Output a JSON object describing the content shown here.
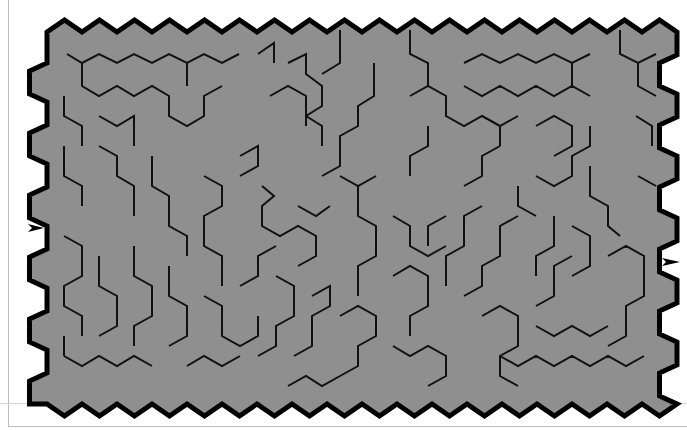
{
  "maze": {
    "type": "hexagonal-maze",
    "colors": {
      "fill": "#8f8f8f",
      "wall": "#111111",
      "border": "#000000",
      "background": "#ffffff"
    },
    "grid": {
      "origin_x": 47,
      "origin_y": 20,
      "hex_width": 35,
      "row_height": 31,
      "cols": 18,
      "rows": 12
    },
    "entrance": {
      "side": "left",
      "x": 28,
      "y": 228,
      "glyph": "arrow-right"
    },
    "exit": {
      "side": "right",
      "x": 668,
      "y": 262,
      "glyph": "arrow-right"
    },
    "walls": [
      [
        [
          67,
          54
        ],
        [
          82,
          63
        ],
        [
          99,
          54
        ],
        [
          117,
          63
        ],
        [
          134,
          54
        ],
        [
          152,
          63
        ],
        [
          169,
          54
        ],
        [
          187,
          63
        ],
        [
          204,
          54
        ],
        [
          222,
          63
        ],
        [
          239,
          54
        ]
      ],
      [
        [
          82,
          63
        ],
        [
          82,
          86
        ],
        [
          99,
          96
        ],
        [
          117,
          86
        ],
        [
          134,
          96
        ],
        [
          152,
          86
        ],
        [
          169,
          96
        ],
        [
          169,
          116
        ],
        [
          187,
          126
        ],
        [
          204,
          116
        ],
        [
          204,
          96
        ],
        [
          222,
          86
        ]
      ],
      [
        [
          187,
          63
        ],
        [
          187,
          86
        ]
      ],
      [
        [
          64,
          96
        ],
        [
          64,
          116
        ],
        [
          82,
          126
        ],
        [
          82,
          146
        ]
      ],
      [
        [
          99,
          116
        ],
        [
          117,
          126
        ],
        [
          134,
          116
        ],
        [
          134,
          146
        ]
      ],
      [
        [
          258,
          54
        ],
        [
          274,
          43
        ],
        [
          274,
          63
        ]
      ],
      [
        [
          288,
          63
        ],
        [
          306,
          54
        ],
        [
          306,
          74
        ],
        [
          322,
          86
        ],
        [
          322,
          106
        ],
        [
          306,
          116
        ],
        [
          306,
          126
        ]
      ],
      [
        [
          270,
          96
        ],
        [
          288,
          86
        ],
        [
          306,
          96
        ],
        [
          306,
          116
        ],
        [
          322,
          126
        ],
        [
          322,
          146
        ]
      ],
      [
        [
          340,
          30
        ],
        [
          340,
          63
        ],
        [
          322,
          74
        ]
      ],
      [
        [
          374,
          63
        ],
        [
          374,
          96
        ],
        [
          358,
          106
        ],
        [
          358,
          126
        ],
        [
          340,
          136
        ],
        [
          340,
          166
        ],
        [
          322,
          176
        ]
      ],
      [
        [
          410,
          30
        ],
        [
          410,
          54
        ],
        [
          428,
          63
        ],
        [
          428,
          86
        ]
      ],
      [
        [
          410,
          96
        ],
        [
          428,
          86
        ],
        [
          446,
          96
        ],
        [
          446,
          116
        ],
        [
          464,
          126
        ],
        [
          482,
          116
        ],
        [
          500,
          126
        ],
        [
          500,
          146
        ]
      ],
      [
        [
          428,
          126
        ],
        [
          428,
          146
        ],
        [
          410,
          156
        ],
        [
          410,
          176
        ]
      ],
      [
        [
          464,
          63
        ],
        [
          482,
          54
        ],
        [
          500,
          63
        ],
        [
          518,
          54
        ],
        [
          536,
          63
        ],
        [
          554,
          54
        ],
        [
          572,
          63
        ],
        [
          590,
          54
        ]
      ],
      [
        [
          464,
          86
        ],
        [
          482,
          96
        ],
        [
          500,
          86
        ],
        [
          518,
          96
        ],
        [
          536,
          86
        ],
        [
          554,
          96
        ],
        [
          572,
          86
        ],
        [
          590,
          96
        ]
      ],
      [
        [
          572,
          63
        ],
        [
          572,
          86
        ]
      ],
      [
        [
          620,
          30
        ],
        [
          620,
          54
        ],
        [
          638,
          63
        ],
        [
          656,
          54
        ]
      ],
      [
        [
          638,
          63
        ],
        [
          638,
          86
        ],
        [
          656,
          96
        ]
      ],
      [
        [
          482,
          116
        ],
        [
          500,
          126
        ],
        [
          518,
          116
        ]
      ],
      [
        [
          500,
          126
        ],
        [
          500,
          146
        ]
      ],
      [
        [
          536,
          126
        ],
        [
          554,
          116
        ],
        [
          572,
          126
        ],
        [
          572,
          146
        ],
        [
          554,
          156
        ]
      ],
      [
        [
          636,
          116
        ],
        [
          652,
          126
        ],
        [
          652,
          146
        ]
      ],
      [
        [
          638,
          176
        ],
        [
          656,
          186
        ]
      ],
      [
        [
          64,
          146
        ],
        [
          64,
          176
        ],
        [
          82,
          186
        ],
        [
          82,
          206
        ]
      ],
      [
        [
          99,
          146
        ],
        [
          117,
          156
        ],
        [
          117,
          176
        ],
        [
          134,
          186
        ],
        [
          134,
          216
        ]
      ],
      [
        [
          152,
          156
        ],
        [
          152,
          186
        ],
        [
          169,
          196
        ],
        [
          169,
          226
        ],
        [
          187,
          236
        ],
        [
          187,
          256
        ]
      ],
      [
        [
          204,
          176
        ],
        [
          222,
          186
        ],
        [
          222,
          206
        ],
        [
          204,
          216
        ],
        [
          204,
          246
        ],
        [
          222,
          256
        ],
        [
          222,
          286
        ]
      ],
      [
        [
          240,
          156
        ],
        [
          258,
          146
        ],
        [
          258,
          166
        ],
        [
          240,
          176
        ]
      ],
      [
        [
          262,
          186
        ],
        [
          274,
          196
        ],
        [
          262,
          206
        ],
        [
          262,
          226
        ],
        [
          280,
          236
        ],
        [
          298,
          226
        ],
        [
          316,
          236
        ],
        [
          316,
          256
        ],
        [
          298,
          266
        ]
      ],
      [
        [
          298,
          206
        ],
        [
          316,
          216
        ],
        [
          330,
          206
        ]
      ],
      [
        [
          340,
          176
        ],
        [
          358,
          186
        ],
        [
          376,
          176
        ]
      ],
      [
        [
          358,
          186
        ],
        [
          358,
          216
        ],
        [
          376,
          226
        ],
        [
          376,
          256
        ],
        [
          358,
          266
        ],
        [
          358,
          296
        ]
      ],
      [
        [
          393,
          216
        ],
        [
          410,
          226
        ],
        [
          410,
          246
        ],
        [
          428,
          256
        ],
        [
          446,
          246
        ]
      ],
      [
        [
          446,
          216
        ],
        [
          428,
          226
        ],
        [
          428,
          246
        ]
      ],
      [
        [
          464,
          186
        ],
        [
          482,
          176
        ],
        [
          482,
          156
        ],
        [
          500,
          146
        ]
      ],
      [
        [
          482,
          206
        ],
        [
          464,
          216
        ],
        [
          464,
          246
        ],
        [
          446,
          256
        ],
        [
          446,
          286
        ]
      ],
      [
        [
          518,
          186
        ],
        [
          518,
          206
        ],
        [
          536,
          216
        ]
      ],
      [
        [
          536,
          176
        ],
        [
          554,
          186
        ],
        [
          572,
          176
        ],
        [
          572,
          156
        ],
        [
          590,
          146
        ],
        [
          590,
          126
        ]
      ],
      [
        [
          590,
          166
        ],
        [
          590,
          196
        ],
        [
          608,
          206
        ],
        [
          608,
          226
        ],
        [
          620,
          236
        ]
      ],
      [
        [
          554,
          216
        ],
        [
          554,
          246
        ],
        [
          536,
          256
        ],
        [
          536,
          276
        ]
      ],
      [
        [
          572,
          226
        ],
        [
          590,
          236
        ],
        [
          590,
          266
        ],
        [
          572,
          276
        ]
      ],
      [
        [
          608,
          256
        ],
        [
          626,
          246
        ],
        [
          644,
          256
        ],
        [
          644,
          296
        ],
        [
          626,
          306
        ],
        [
          626,
          336
        ],
        [
          608,
          346
        ]
      ],
      [
        [
          64,
          236
        ],
        [
          82,
          246
        ],
        [
          82,
          276
        ],
        [
          64,
          286
        ],
        [
          64,
          306
        ],
        [
          82,
          316
        ],
        [
          82,
          336
        ]
      ],
      [
        [
          99,
          256
        ],
        [
          99,
          286
        ],
        [
          117,
          296
        ],
        [
          117,
          326
        ],
        [
          99,
          336
        ]
      ],
      [
        [
          134,
          246
        ],
        [
          134,
          276
        ],
        [
          152,
          286
        ],
        [
          152,
          316
        ],
        [
          134,
          326
        ],
        [
          134,
          346
        ]
      ],
      [
        [
          169,
          266
        ],
        [
          169,
          296
        ],
        [
          187,
          306
        ],
        [
          187,
          336
        ],
        [
          169,
          346
        ]
      ],
      [
        [
          204,
          296
        ],
        [
          222,
          306
        ],
        [
          222,
          336
        ],
        [
          240,
          346
        ],
        [
          258,
          336
        ],
        [
          258,
          316
        ]
      ],
      [
        [
          240,
          286
        ],
        [
          258,
          276
        ],
        [
          258,
          256
        ],
        [
          276,
          246
        ]
      ],
      [
        [
          276,
          276
        ],
        [
          294,
          286
        ],
        [
          294,
          316
        ],
        [
          276,
          326
        ],
        [
          276,
          346
        ],
        [
          258,
          356
        ]
      ],
      [
        [
          312,
          296
        ],
        [
          330,
          286
        ],
        [
          330,
          306
        ],
        [
          312,
          316
        ],
        [
          312,
          346
        ],
        [
          294,
          356
        ]
      ],
      [
        [
          340,
          316
        ],
        [
          358,
          306
        ],
        [
          376,
          316
        ],
        [
          376,
          336
        ],
        [
          358,
          346
        ],
        [
          358,
          366
        ],
        [
          340,
          376
        ]
      ],
      [
        [
          393,
          276
        ],
        [
          410,
          266
        ],
        [
          428,
          276
        ],
        [
          428,
          306
        ],
        [
          410,
          316
        ],
        [
          410,
          336
        ]
      ],
      [
        [
          393,
          346
        ],
        [
          410,
          356
        ],
        [
          428,
          346
        ],
        [
          446,
          356
        ],
        [
          446,
          376
        ],
        [
          428,
          386
        ]
      ],
      [
        [
          464,
          296
        ],
        [
          482,
          286
        ],
        [
          482,
          266
        ],
        [
          500,
          256
        ],
        [
          500,
          226
        ],
        [
          518,
          216
        ]
      ],
      [
        [
          482,
          316
        ],
        [
          500,
          306
        ],
        [
          518,
          316
        ],
        [
          518,
          346
        ],
        [
          500,
          356
        ],
        [
          500,
          376
        ],
        [
          518,
          386
        ]
      ],
      [
        [
          536,
          306
        ],
        [
          554,
          296
        ],
        [
          554,
          266
        ],
        [
          572,
          256
        ]
      ],
      [
        [
          500,
          356
        ],
        [
          518,
          366
        ],
        [
          536,
          356
        ],
        [
          554,
          366
        ],
        [
          572,
          356
        ],
        [
          590,
          366
        ],
        [
          608,
          356
        ],
        [
          626,
          366
        ],
        [
          644,
          356
        ]
      ],
      [
        [
          536,
          326
        ],
        [
          554,
          336
        ],
        [
          572,
          326
        ],
        [
          590,
          336
        ],
        [
          608,
          326
        ]
      ],
      [
        [
          64,
          356
        ],
        [
          82,
          366
        ],
        [
          99,
          356
        ],
        [
          117,
          366
        ],
        [
          134,
          356
        ],
        [
          152,
          366
        ]
      ],
      [
        [
          64,
          336
        ],
        [
          64,
          356
        ]
      ],
      [
        [
          187,
          366
        ],
        [
          204,
          356
        ],
        [
          222,
          366
        ],
        [
          240,
          356
        ]
      ],
      [
        [
          288,
          386
        ],
        [
          306,
          376
        ],
        [
          322,
          386
        ],
        [
          340,
          376
        ]
      ]
    ]
  }
}
